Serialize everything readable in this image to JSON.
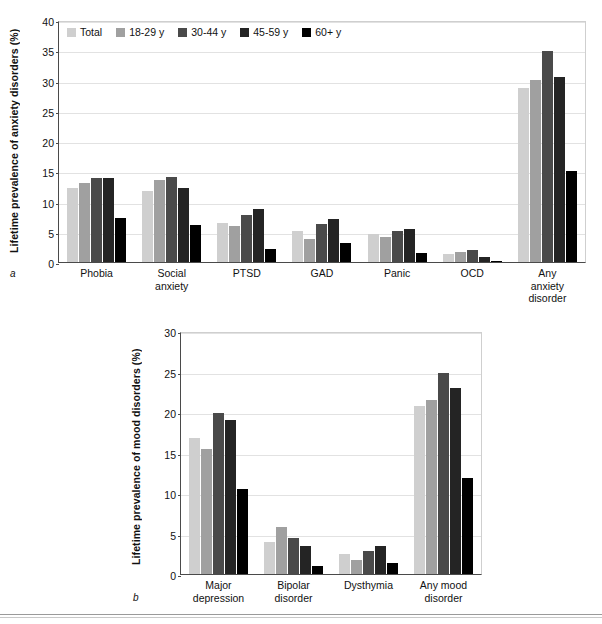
{
  "series_colors": [
    "#cfcfcf",
    "#a0a0a0",
    "#4a4a4a",
    "#242424",
    "#000000"
  ],
  "legend": {
    "items": [
      {
        "label": "Total",
        "color": "#cfcfcf"
      },
      {
        "label": "18-29 y",
        "color": "#a0a0a0"
      },
      {
        "label": "30-44 y",
        "color": "#4a4a4a"
      },
      {
        "label": "45-59 y",
        "color": "#242424"
      },
      {
        "label": "60+ y",
        "color": "#000000"
      }
    ]
  },
  "panel_a": {
    "letter": "a",
    "ylabel": "Lifetime prevalence of anxiety disorders (%)",
    "yticks": [
      "0",
      "5",
      "10",
      "15",
      "20",
      "25",
      "30",
      "35",
      "40"
    ],
    "categories": [
      "Phobia",
      "Social\nanxiety",
      "PTSD",
      "GAD",
      "Panic",
      "OCD",
      "Any\nanxiety\ndisorder"
    ]
  },
  "panel_b": {
    "letter": "b",
    "ylabel": "Lifetime prevalence of mood disorders (%)",
    "yticks": [
      "0",
      "5",
      "10",
      "15",
      "20",
      "25",
      "30"
    ],
    "categories": [
      "Major\ndepression",
      "Bipolar\ndisorder",
      "Dysthymia",
      "Any mood\ndisorder"
    ]
  },
  "chart_data": [
    {
      "type": "bar",
      "panel": "a",
      "title": "",
      "xlabel": "",
      "ylabel": "Lifetime prevalence of anxiety disorders (%)",
      "ylim": [
        0,
        40
      ],
      "ytick_step": 5,
      "grid": true,
      "legend_position": "top-left inside plot",
      "categories": [
        "Phobia",
        "Social anxiety",
        "PTSD",
        "GAD",
        "Panic",
        "OCD",
        "Any anxiety disorder"
      ],
      "series": [
        {
          "name": "Total",
          "color": "#cfcfcf",
          "values": [
            12.3,
            11.8,
            6.5,
            5.2,
            4.6,
            1.3,
            28.7
          ]
        },
        {
          "name": "18-29 y",
          "color": "#a0a0a0",
          "values": [
            13.0,
            13.5,
            5.9,
            3.8,
            4.2,
            1.7,
            30.1
          ]
        },
        {
          "name": "30-44 y",
          "color": "#4a4a4a",
          "values": [
            13.9,
            14.1,
            7.8,
            6.3,
            5.2,
            2.0,
            34.8
          ]
        },
        {
          "name": "45-59 y",
          "color": "#242424",
          "values": [
            13.9,
            12.2,
            8.7,
            7.1,
            5.4,
            0.9,
            30.5
          ]
        },
        {
          "name": "60+ y",
          "color": "#000000",
          "values": [
            7.2,
            6.2,
            2.2,
            3.2,
            1.5,
            0.2,
            15.1
          ]
        }
      ]
    },
    {
      "type": "bar",
      "panel": "b",
      "title": "",
      "xlabel": "",
      "ylabel": "Lifetime prevalence of mood disorders (%)",
      "ylim": [
        0,
        30
      ],
      "ytick_step": 5,
      "grid": true,
      "legend_position": "none",
      "categories": [
        "Major depression",
        "Bipolar disorder",
        "Dysthymia",
        "Any mood disorder"
      ],
      "series": [
        {
          "name": "Total",
          "color": "#cfcfcf",
          "values": [
            16.8,
            4.0,
            2.5,
            20.8
          ]
        },
        {
          "name": "18-29 y",
          "color": "#a0a0a0",
          "values": [
            15.4,
            5.8,
            1.7,
            21.5
          ]
        },
        {
          "name": "30-44 y",
          "color": "#4a4a4a",
          "values": [
            19.9,
            4.4,
            2.8,
            24.8
          ]
        },
        {
          "name": "45-59 y",
          "color": "#242424",
          "values": [
            19.0,
            3.4,
            3.5,
            23.0
          ]
        },
        {
          "name": "60+ y",
          "color": "#000000",
          "values": [
            10.5,
            1.0,
            1.3,
            11.8
          ]
        }
      ]
    }
  ]
}
